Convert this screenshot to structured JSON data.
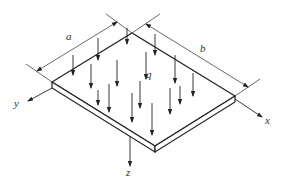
{
  "diagram": {
    "labels": {
      "side_a": "a",
      "side_b": "b",
      "load": "q",
      "axis_x": "x",
      "axis_y": "y",
      "axis_z": "z"
    },
    "colors": {
      "line": "#222222",
      "thin": "#444444",
      "background": "#ffffff"
    },
    "plate": {
      "corners": {
        "left": [
          52,
          82
        ],
        "top": [
          132,
          33
        ],
        "right": [
          235,
          96
        ],
        "bottom": [
          155,
          150
        ]
      },
      "thickness": 6
    },
    "load_arrow_count": 16
  }
}
